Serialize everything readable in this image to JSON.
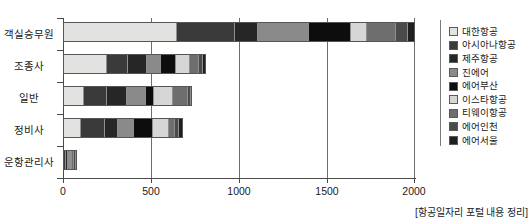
{
  "chart_data": {
    "type": "bar",
    "orientation": "horizontal",
    "stacked": true,
    "title": "",
    "subtitle": "",
    "xlabel": "",
    "ylabel": "",
    "xlim": [
      0,
      2000
    ],
    "xticks": [
      "0",
      "500",
      "1000",
      "1500",
      "2000"
    ],
    "xtick_values": [
      0,
      500,
      1000,
      1500,
      2000
    ],
    "grid": true,
    "legend_position": "right",
    "categories": [
      "객실승무원",
      "조종사",
      "일반",
      "정비사",
      "운항관리사"
    ],
    "series": [
      {
        "name": "대한항공",
        "color": "#e2e2e0",
        "values": [
          650,
          250,
          120,
          100,
          8
        ]
      },
      {
        "name": "아시아나항공",
        "color": "#3a3a3a",
        "values": [
          330,
          120,
          130,
          140,
          10
        ]
      },
      {
        "name": "제주항공",
        "color": "#262626",
        "values": [
          130,
          110,
          115,
          75,
          8
        ]
      },
      {
        "name": "진에어",
        "color": "#8a8a8a",
        "values": [
          290,
          75,
          105,
          90,
          12
        ]
      },
      {
        "name": "에어부산",
        "color": "#0d0d0d",
        "values": [
          235,
          85,
          45,
          105,
          7
        ]
      },
      {
        "name": "이스타항공",
        "color": "#d6d6d4",
        "values": [
          95,
          80,
          110,
          95,
          6
        ]
      },
      {
        "name": "티웨이항공",
        "color": "#6e6e6e",
        "values": [
          160,
          55,
          85,
          30,
          14
        ]
      },
      {
        "name": "에어인천",
        "color": "#4a4a4a",
        "values": [
          70,
          20,
          15,
          22,
          7
        ]
      },
      {
        "name": "에어서울",
        "color": "#1f1f1f",
        "values": [
          40,
          15,
          10,
          23,
          8
        ]
      }
    ],
    "totals": [
      2000,
      810,
      735,
      680,
      80
    ],
    "annotations": [
      "[항공일자리 포털 내용 정리]"
    ]
  },
  "legend": {
    "items": [
      {
        "label": "대한항공"
      },
      {
        "label": "아시아나항공"
      },
      {
        "label": "제주항공"
      },
      {
        "label": "진에어"
      },
      {
        "label": "에어부산"
      },
      {
        "label": "이스타항공"
      },
      {
        "label": "티웨이항공"
      },
      {
        "label": "에어인천"
      },
      {
        "label": "에어서울"
      }
    ]
  },
  "caption": {
    "text": "[항공일자리 포털 내용 정리]"
  }
}
